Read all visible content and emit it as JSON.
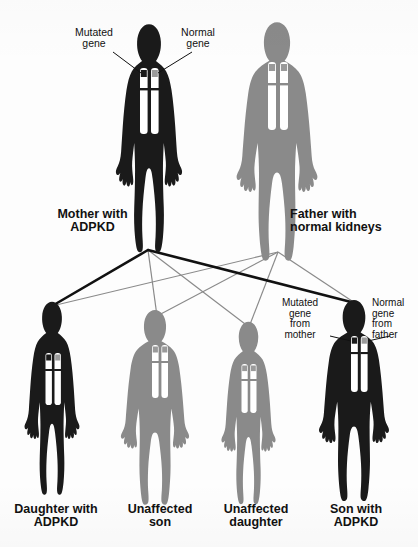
{
  "diagram": {
    "colors": {
      "affected_body": "#1a1a1a",
      "unaffected_body": "#8a8a8a",
      "mutated_gene": "#1a1a1a",
      "normal_gene": "#9a9a9a",
      "chromosome": "#ffffff",
      "line_affected": "#111111",
      "line_unaffected": "#8a8a8a",
      "background": "#fdfdfd",
      "text": "#111111"
    }
  },
  "parents": [
    {
      "id": "mother",
      "label_line1": "Mother with",
      "label_line2": "ADPKD",
      "status": "affected",
      "body_color": "#1a1a1a",
      "genes": [
        "mutated",
        "normal"
      ],
      "annotations": [
        {
          "id": "mutated-gene",
          "line1": "Mutated",
          "line2": "gene",
          "side": "left"
        },
        {
          "id": "normal-gene",
          "line1": "Normal",
          "line2": "gene",
          "side": "right"
        }
      ]
    },
    {
      "id": "father",
      "label_line1": "Father with",
      "label_line2": "normal kidneys",
      "status": "unaffected",
      "body_color": "#8a8a8a",
      "genes": [
        "normal",
        "normal"
      ],
      "annotations": []
    }
  ],
  "children": [
    {
      "id": "daughter-adpkd",
      "label_line1": "Daughter with",
      "label_line2": "ADPKD",
      "status": "affected",
      "body_color": "#1a1a1a",
      "genes": [
        "mutated",
        "normal"
      ],
      "sex": "female",
      "annotations": []
    },
    {
      "id": "unaffected-son",
      "label_line1": "Unaffected",
      "label_line2": "son",
      "status": "unaffected",
      "body_color": "#8a8a8a",
      "genes": [
        "normal",
        "normal"
      ],
      "sex": "male",
      "annotations": []
    },
    {
      "id": "unaffected-daughter",
      "label_line1": "Unaffected",
      "label_line2": "daughter",
      "status": "unaffected",
      "body_color": "#8a8a8a",
      "genes": [
        "normal",
        "normal"
      ],
      "sex": "female",
      "annotations": []
    },
    {
      "id": "son-adpkd",
      "label_line1": "Son with",
      "label_line2": "ADPKD",
      "status": "affected",
      "body_color": "#1a1a1a",
      "genes": [
        "mutated",
        "normal"
      ],
      "sex": "male",
      "annotations": [
        {
          "id": "mutated-gene-from-mother",
          "line1": "Mutated",
          "line2": "gene",
          "line3": "from",
          "line4": "mother",
          "side": "left"
        },
        {
          "id": "normal-gene-from-father",
          "line1": "Normal",
          "line2": "gene",
          "line3": "from",
          "line4": "father",
          "side": "right"
        }
      ]
    }
  ],
  "inheritance_lines": [
    {
      "from": "mother",
      "to": "daughter-adpkd",
      "type": "affected"
    },
    {
      "from": "mother",
      "to": "unaffected-son",
      "type": "unaffected"
    },
    {
      "from": "mother",
      "to": "unaffected-daughter",
      "type": "unaffected"
    },
    {
      "from": "mother",
      "to": "son-adpkd",
      "type": "affected"
    },
    {
      "from": "father",
      "to": "daughter-adpkd",
      "type": "unaffected"
    },
    {
      "from": "father",
      "to": "unaffected-son",
      "type": "unaffected"
    },
    {
      "from": "father",
      "to": "unaffected-daughter",
      "type": "unaffected"
    },
    {
      "from": "father",
      "to": "son-adpkd",
      "type": "unaffected"
    }
  ]
}
